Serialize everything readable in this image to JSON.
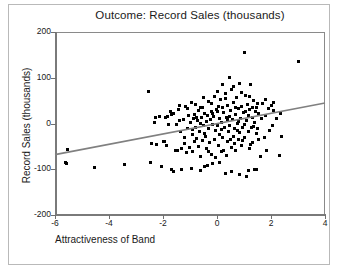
{
  "chart_data": {
    "type": "scatter",
    "title": "Outcome: Record Sales (thousands)",
    "xlabel": "Attractiveness of Band",
    "ylabel": "Record Sales (thousands)",
    "xlim": [
      -6,
      4
    ],
    "ylim": [
      -200,
      200
    ],
    "xticks": [
      -6,
      -4,
      -2,
      0,
      2,
      4
    ],
    "xtick_labels": [
      "-6",
      "-4",
      "-2",
      "0",
      "2",
      "4"
    ],
    "yticks": [
      200,
      100,
      0,
      -100,
      -200
    ],
    "ytick_labels": [
      "200",
      "100",
      "0",
      "-100",
      "-200"
    ],
    "grid": false,
    "legend": null,
    "marker": "square",
    "marker_color": "#000000",
    "marker_size_px": 3,
    "trendline": {
      "type": "linear",
      "color": "#808080",
      "x": [
        -6,
        4
      ],
      "y": [
        -68,
        45
      ],
      "slope": 11.3,
      "intercept": 0.2
    },
    "points": [
      [
        -5.62,
        -85
      ],
      [
        -5.58,
        -88
      ],
      [
        -5.55,
        -57
      ],
      [
        -4.55,
        -97
      ],
      [
        -3.42,
        -90
      ],
      [
        -2.52,
        70
      ],
      [
        -2.48,
        -85
      ],
      [
        -2.42,
        -43
      ],
      [
        -2.3,
        2
      ],
      [
        -2.28,
        14
      ],
      [
        -2.25,
        -45
      ],
      [
        -2.12,
        16
      ],
      [
        -2.05,
        -94
      ],
      [
        -1.95,
        -40
      ],
      [
        -1.92,
        14
      ],
      [
        -1.88,
        -48
      ],
      [
        -1.85,
        16
      ],
      [
        -1.78,
        -2
      ],
      [
        -1.72,
        26
      ],
      [
        -1.68,
        -100
      ],
      [
        -1.62,
        22
      ],
      [
        -1.55,
        -58
      ],
      [
        -1.5,
        -2
      ],
      [
        -1.45,
        -60
      ],
      [
        -1.42,
        30
      ],
      [
        -1.38,
        40
      ],
      [
        -1.35,
        -18
      ],
      [
        -1.3,
        -55
      ],
      [
        -1.25,
        8
      ],
      [
        -1.22,
        -30
      ],
      [
        -1.18,
        38
      ],
      [
        -1.12,
        -63
      ],
      [
        -1.08,
        -12
      ],
      [
        -1.05,
        18
      ],
      [
        -1.02,
        -52
      ],
      [
        -0.98,
        2
      ],
      [
        -0.95,
        45
      ],
      [
        -0.92,
        -25
      ],
      [
        -0.9,
        -62
      ],
      [
        -0.88,
        10
      ],
      [
        -0.85,
        -40
      ],
      [
        -0.82,
        20
      ],
      [
        -0.78,
        -8
      ],
      [
        -0.75,
        -32
      ],
      [
        -0.72,
        6
      ],
      [
        -0.7,
        -50
      ],
      [
        -0.68,
        28
      ],
      [
        -0.65,
        -18
      ],
      [
        -0.62,
        0
      ],
      [
        -0.6,
        -72
      ],
      [
        -0.58,
        14
      ],
      [
        -0.55,
        -38
      ],
      [
        -0.52,
        34
      ],
      [
        -0.5,
        -5
      ],
      [
        -0.48,
        -95
      ],
      [
        -0.45,
        22
      ],
      [
        -0.42,
        -28
      ],
      [
        -0.4,
        4
      ],
      [
        -0.38,
        -55
      ],
      [
        -0.35,
        18
      ],
      [
        -0.32,
        -10
      ],
      [
        -0.3,
        48
      ],
      [
        -0.28,
        -42
      ],
      [
        -0.25,
        8
      ],
      [
        -0.22,
        -68
      ],
      [
        -0.2,
        26
      ],
      [
        -0.18,
        -2
      ],
      [
        -0.15,
        -88
      ],
      [
        -0.12,
        16
      ],
      [
        -0.1,
        -35
      ],
      [
        -0.08,
        60
      ],
      [
        -0.05,
        -15
      ],
      [
        -0.02,
        30
      ],
      [
        0,
        -5
      ],
      [
        0.02,
        70
      ],
      [
        0.05,
        -48
      ],
      [
        0.08,
        12
      ],
      [
        0.1,
        -25
      ],
      [
        0.12,
        52
      ],
      [
        0.15,
        -62
      ],
      [
        0.18,
        2
      ],
      [
        0.2,
        86
      ],
      [
        0.22,
        -30
      ],
      [
        0.25,
        24
      ],
      [
        0.28,
        -8
      ],
      [
        0.3,
        66
      ],
      [
        0.32,
        -110
      ],
      [
        0.35,
        14
      ],
      [
        0.38,
        -40
      ],
      [
        0.4,
        40
      ],
      [
        0.42,
        -18
      ],
      [
        0.45,
        100
      ],
      [
        0.48,
        -5
      ],
      [
        0.5,
        28
      ],
      [
        0.52,
        -52
      ],
      [
        0.55,
        74
      ],
      [
        0.58,
        8
      ],
      [
        0.6,
        -28
      ],
      [
        0.62,
        46
      ],
      [
        0.65,
        -12
      ],
      [
        0.68,
        20
      ],
      [
        0.7,
        -60
      ],
      [
        0.72,
        56
      ],
      [
        0.75,
        0
      ],
      [
        0.78,
        -35
      ],
      [
        0.8,
        32
      ],
      [
        0.82,
        88
      ],
      [
        0.85,
        -20
      ],
      [
        0.88,
        12
      ],
      [
        0.9,
        -48
      ],
      [
        0.92,
        38
      ],
      [
        0.95,
        -8
      ],
      [
        0.98,
        24
      ],
      [
        1.0,
        155
      ],
      [
        1.02,
        -30
      ],
      [
        1.05,
        62
      ],
      [
        1.08,
        6
      ],
      [
        1.1,
        -115
      ],
      [
        1.12,
        42
      ],
      [
        1.15,
        -18
      ],
      [
        1.18,
        18
      ],
      [
        1.2,
        -55
      ],
      [
        1.22,
        30
      ],
      [
        1.25,
        86
      ],
      [
        1.28,
        -8
      ],
      [
        1.3,
        14
      ],
      [
        1.32,
        -42
      ],
      [
        1.35,
        50
      ],
      [
        1.38,
        2
      ],
      [
        1.4,
        -100
      ],
      [
        1.42,
        26
      ],
      [
        1.45,
        -22
      ],
      [
        1.48,
        36
      ],
      [
        1.5,
        -12
      ],
      [
        1.55,
        22
      ],
      [
        1.6,
        -72
      ],
      [
        1.65,
        10
      ],
      [
        1.7,
        44
      ],
      [
        1.75,
        -30
      ],
      [
        1.8,
        18
      ],
      [
        1.85,
        -58
      ],
      [
        1.9,
        32
      ],
      [
        1.95,
        -15
      ],
      [
        2.0,
        40
      ],
      [
        2.05,
        -4
      ],
      [
        2.1,
        28
      ],
      [
        2.2,
        12
      ],
      [
        2.3,
        -70
      ],
      [
        2.35,
        22
      ],
      [
        2.4,
        -28
      ],
      [
        3.0,
        135
      ],
      [
        -1.6,
        -105
      ],
      [
        -1.3,
        -100
      ],
      [
        -0.95,
        -98
      ],
      [
        -0.62,
        -102
      ],
      [
        -0.35,
        -92
      ],
      [
        0.1,
        -85
      ],
      [
        0.55,
        -105
      ],
      [
        0.85,
        -112
      ],
      [
        1.15,
        -102
      ],
      [
        1.45,
        -100
      ],
      [
        -2.0,
        -40
      ],
      [
        -1.7,
        20
      ],
      [
        -1.4,
        6
      ],
      [
        -1.1,
        32
      ],
      [
        -0.8,
        42
      ],
      [
        -0.5,
        56
      ],
      [
        -0.2,
        44
      ],
      [
        0.05,
        38
      ],
      [
        0.3,
        54
      ],
      [
        0.6,
        80
      ],
      [
        0.9,
        68
      ],
      [
        1.2,
        58
      ],
      [
        1.5,
        44
      ],
      [
        1.8,
        52
      ],
      [
        2.1,
        46
      ],
      [
        -0.75,
        14
      ],
      [
        -0.45,
        -22
      ],
      [
        -0.15,
        22
      ],
      [
        0.15,
        -14
      ],
      [
        0.45,
        16
      ],
      [
        0.75,
        -16
      ],
      [
        1.05,
        26
      ],
      [
        1.35,
        -6
      ],
      [
        0.2,
        34
      ],
      [
        0.5,
        -36
      ],
      [
        0.8,
        4
      ],
      [
        -0.9,
        -14
      ],
      [
        -0.6,
        34
      ],
      [
        -0.3,
        -62
      ],
      [
        0.35,
        -70
      ],
      [
        0.65,
        -44
      ],
      [
        0.95,
        -38
      ],
      [
        1.25,
        -46
      ],
      [
        1.55,
        -34
      ],
      [
        0.0,
        26
      ],
      [
        0.25,
        -58
      ],
      [
        0.4,
        8
      ],
      [
        0.7,
        36
      ],
      [
        1.0,
        -2
      ],
      [
        1.3,
        34
      ],
      [
        -1.2,
        -44
      ],
      [
        -0.05,
        -75
      ]
    ]
  }
}
